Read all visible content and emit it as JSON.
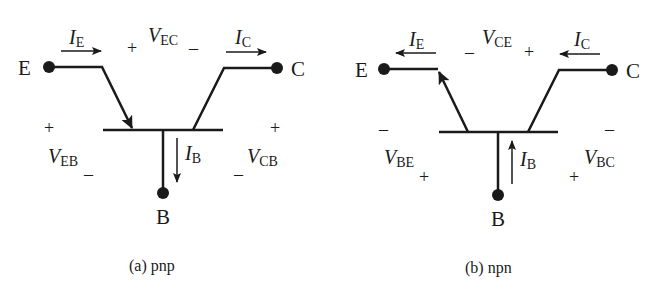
{
  "diagrams": [
    {
      "id": "a",
      "type": "pnp",
      "caption": "(a) pnp",
      "terminals": {
        "emitter": "E",
        "collector": "C",
        "base": "B"
      },
      "currents": {
        "emitter": {
          "symbol": "I",
          "subscript": "E",
          "direction": "into-emitter (right)"
        },
        "collector": {
          "symbol": "I",
          "subscript": "C",
          "direction": "out-of-collector (right)"
        },
        "base": {
          "symbol": "I",
          "subscript": "B",
          "direction": "out-of-base (down)"
        }
      },
      "voltages": {
        "top": {
          "symbol": "V",
          "subscript": "EC",
          "plus": "+",
          "minus": "–"
        },
        "left": {
          "symbol": "V",
          "subscript": "EB",
          "plus": "+",
          "minus": "–"
        },
        "right": {
          "symbol": "V",
          "subscript": "CB",
          "plus": "+",
          "minus": "–"
        }
      }
    },
    {
      "id": "b",
      "type": "npn",
      "caption": "(b) npn",
      "terminals": {
        "emitter": "E",
        "collector": "C",
        "base": "B"
      },
      "currents": {
        "emitter": {
          "symbol": "I",
          "subscript": "E",
          "direction": "out-of-emitter (left)"
        },
        "collector": {
          "symbol": "I",
          "subscript": "C",
          "direction": "into-collector (left)"
        },
        "base": {
          "symbol": "I",
          "subscript": "B",
          "direction": "into-base (up)"
        }
      },
      "voltages": {
        "top": {
          "symbol": "V",
          "subscript": "CE",
          "plus": "+",
          "minus": "–"
        },
        "left": {
          "symbol": "V",
          "subscript": "BE",
          "plus": "+",
          "minus": "–"
        },
        "right": {
          "symbol": "V",
          "subscript": "BC",
          "plus": "+",
          "minus": "–"
        }
      }
    }
  ],
  "colors": {
    "ink": "#1a1a1a",
    "background": "#ffffff"
  }
}
